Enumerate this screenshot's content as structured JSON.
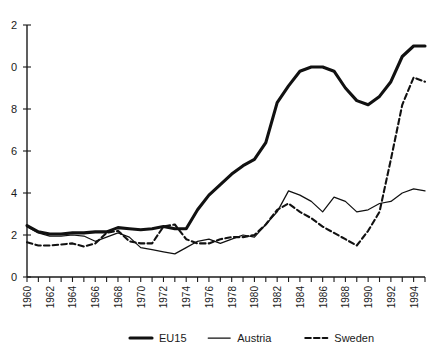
{
  "chart_data": {
    "type": "line",
    "title": "",
    "xlabel": "",
    "ylabel": "",
    "xlim": [
      1960,
      1995
    ],
    "ylim": [
      0,
      12
    ],
    "grid": false,
    "legend_position": "bottom-center",
    "y_ticks": [
      0,
      2,
      4,
      6,
      8,
      10,
      12
    ],
    "y_tick_labels": [
      "0",
      "2",
      "4",
      "6",
      "8",
      "0",
      "2"
    ],
    "y_tick_labels_note": "Top two labels are clipped at the left image edge; full values are 10 and 12",
    "x_ticks": [
      1960,
      1961,
      1962,
      1963,
      1964,
      1965,
      1966,
      1967,
      1968,
      1969,
      1970,
      1971,
      1972,
      1973,
      1974,
      1975,
      1976,
      1977,
      1978,
      1979,
      1980,
      1981,
      1982,
      1983,
      1984,
      1985,
      1986,
      1987,
      1988,
      1989,
      1990,
      1991,
      1992,
      1993,
      1994,
      1995
    ],
    "x_tick_labels": [
      "1960",
      "1962",
      "1964",
      "1966",
      "1968",
      "1970",
      "1972",
      "1974",
      "1976",
      "1978",
      "1980",
      "1982",
      "1984",
      "1986",
      "1988",
      "1990",
      "1992",
      "1994"
    ],
    "x_tick_label_years": [
      1960,
      1962,
      1964,
      1966,
      1968,
      1970,
      1972,
      1974,
      1976,
      1978,
      1980,
      1982,
      1984,
      1986,
      1988,
      1990,
      1992,
      1994
    ],
    "x": [
      1960,
      1961,
      1962,
      1963,
      1964,
      1965,
      1966,
      1967,
      1968,
      1969,
      1970,
      1971,
      1972,
      1973,
      1974,
      1975,
      1976,
      1977,
      1978,
      1979,
      1980,
      1981,
      1982,
      1983,
      1984,
      1985,
      1986,
      1987,
      1988,
      1989,
      1990,
      1991,
      1992,
      1993,
      1994,
      1995
    ],
    "series": [
      {
        "name": "EU15",
        "style": "thick-solid",
        "values": [
          2.45,
          2.15,
          2.05,
          2.05,
          2.1,
          2.1,
          2.15,
          2.15,
          2.35,
          2.3,
          2.25,
          2.3,
          2.4,
          2.3,
          2.3,
          3.2,
          3.9,
          4.4,
          4.9,
          5.3,
          5.6,
          6.4,
          8.3,
          9.1,
          9.8,
          10.0,
          10.0,
          9.8,
          9.0,
          8.4,
          8.2,
          8.6,
          9.3,
          10.5,
          11.0,
          11.0
        ]
      },
      {
        "name": "Austria",
        "style": "thin-solid",
        "values": [
          2.4,
          2.1,
          1.95,
          1.95,
          2.0,
          1.95,
          1.7,
          1.9,
          2.1,
          1.9,
          1.4,
          1.3,
          1.2,
          1.1,
          1.4,
          1.7,
          1.8,
          1.6,
          1.8,
          2.0,
          1.9,
          2.5,
          3.1,
          4.1,
          3.9,
          3.6,
          3.1,
          3.8,
          3.6,
          3.1,
          3.2,
          3.5,
          3.6,
          4.0,
          4.2,
          4.1
        ]
      },
      {
        "name": "Sweden",
        "style": "dashed",
        "values": [
          1.65,
          1.5,
          1.5,
          1.55,
          1.6,
          1.45,
          1.6,
          2.1,
          2.2,
          1.7,
          1.6,
          1.6,
          2.4,
          2.5,
          1.8,
          1.6,
          1.6,
          1.8,
          1.9,
          1.9,
          2.0,
          2.5,
          3.2,
          3.5,
          3.1,
          2.8,
          2.4,
          2.1,
          1.8,
          1.5,
          2.2,
          3.1,
          5.6,
          8.2,
          9.5,
          9.3
        ]
      }
    ]
  },
  "legend": {
    "items": [
      {
        "label": "EU15",
        "style": "thick-solid"
      },
      {
        "label": "Austria",
        "style": "thin-solid"
      },
      {
        "label": "Sweden",
        "style": "dashed"
      }
    ]
  }
}
